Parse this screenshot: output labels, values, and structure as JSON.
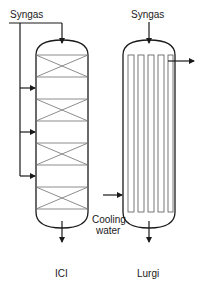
{
  "diagram": {
    "reactors": [
      {
        "name": "ICI",
        "type": "quench reactor (multi-bed with intermediate syngas injection)",
        "inlet_label": "Syngas",
        "catalyst_beds": 4,
        "quench_injections": 3
      },
      {
        "name": "Lurgi",
        "type": "tubular reactor (cooled)",
        "inlet_label": "Syngas",
        "coolant_label": "Cooling water",
        "tubes": 5
      }
    ],
    "labels": {
      "ici_syngas": "Syngas",
      "lurgi_syngas": "Syngas",
      "cooling_line1": "Cooling",
      "cooling_line2": "water",
      "ici_name": "ICI",
      "lurgi_name": "Lurgi"
    },
    "colors": {
      "line": "#1a1a1a",
      "bed_line": "#6e6e6e",
      "background": "#ffffff"
    }
  }
}
